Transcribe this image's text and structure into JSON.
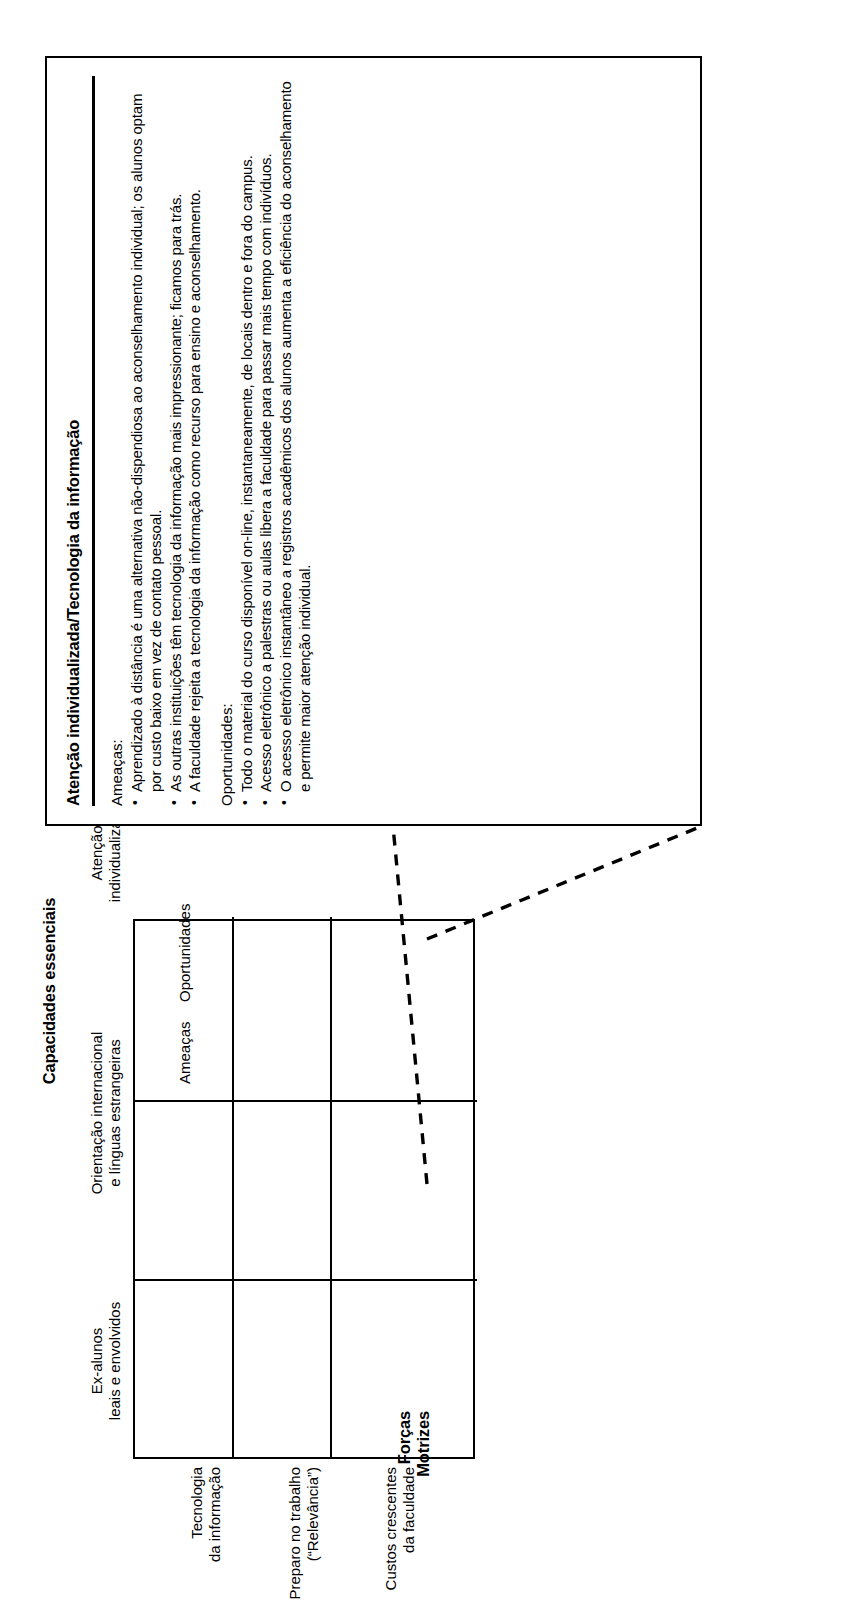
{
  "diagram": {
    "column_group_title": "Capacidades essenciais",
    "row_group_title": "Forças\nMotrizes",
    "columns": [
      "Ex-alunos\nleais e envolvidos",
      "Orientação internacional\ne línguas estrangeiras",
      "Atenção\nindividualizada"
    ],
    "rows": [
      "Tecnologia\nda informação",
      "Preparo no trabalho\n(“Relevância”)",
      "Custos crescentes\nda faculdade"
    ],
    "cell_labels": {
      "threats": "Ameaças",
      "opportunities": "Oportunidades"
    }
  },
  "callout": {
    "title": "Atenção individualizada/Tecnologia da informação",
    "threats_label": "Ameaças:",
    "threats": [
      "Aprendizado à distância é uma alternativa não-dispendiosa ao aconselhamento individual; os alunos optam por custo baixo em vez de contato pessoal.",
      "As outras instituições têm tecnologia da informação mais impressionante; ficamos para trás.",
      "A faculdade rejeita a tecnologia da informação como recurso para ensino e aconselhamento."
    ],
    "opportunities_label": "Oportunidades:",
    "opportunities": [
      "Todo o material do curso disponível on-line, instantaneamente, de locais dentro e fora do campus.",
      "Acesso eletrônico a palestras ou aulas libera a faculdade para passar mais tempo com indivíduos.",
      "O acesso eletrônico instantâneo a registros acadêmicos dos alunos aumenta a eficiência do aconselhamento e permite maior atenção individual."
    ]
  },
  "colors": {
    "ink": "#000000",
    "paper": "#ffffff"
  }
}
